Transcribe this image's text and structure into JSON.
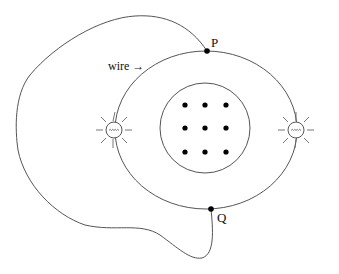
{
  "diagram": {
    "labels": {
      "wire": "wire →",
      "point_p": "P",
      "point_q": "Q"
    },
    "elements": {
      "outer_loop_wire": "wire loop from P around left side to Q",
      "circuit_ring": "elliptical circuit ring containing two bulbs",
      "magnetic_region": "circular region with magnetic field out of page",
      "field_dots_count": 9,
      "bulbs": [
        "left-bulb",
        "right-bulb"
      ]
    },
    "colors": {
      "line": "#555555",
      "dot": "#000000",
      "background": "#ffffff"
    }
  }
}
